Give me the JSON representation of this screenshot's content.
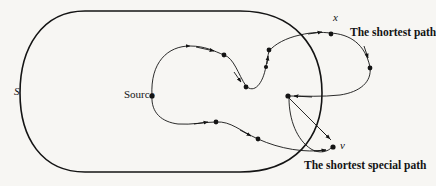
{
  "figure": {
    "type": "diagram",
    "width": 436,
    "height": 186,
    "background_color": "#f7f6f3",
    "stroke_color": "#141414",
    "node_color": "#141414"
  },
  "labels": {
    "region": "S",
    "source": "Source",
    "node_x": "x",
    "node_v": "v",
    "shortest_path": "The shortest path",
    "shortest_special_path": "The shortest special path"
  },
  "geometry": {
    "region_boundary": {
      "name": "set-S-boundary",
      "description": "large rounded stadium shape enclosing the left portion of the figure",
      "path": "M 85 11 L 240 11 C 295 11 322 48 322 93 C 322 138 295 172 240 172 L 85 172 C 42 172 20 138 20 93 C 20 48 42 11 85 11 Z"
    },
    "upper_path": {
      "name": "shortest-path-curve",
      "description": "wavy curve from Source rightward through interior nodes up to node x, then looping right and back to the junction node",
      "segments": [
        "M 152 96 C 152 60 168 46 190 46 C 208 46 215 52 224 55",
        "M 224 55 C 236 59 239 77 246 85 C 253 93 262 82 266 70 C 271 56 276 46 286 42 C 300 36 313 32 330 32",
        "M 330 32 C 352 32 368 44 370 58 C 372 73 363 86 350 92 C 335 99 310 97 290 96"
      ],
      "nodes": [
        {
          "name": "node-source",
          "x": 152,
          "y": 96
        },
        {
          "name": "node-u1",
          "x": 224,
          "y": 55
        },
        {
          "name": "node-u2",
          "x": 246,
          "y": 86
        },
        {
          "name": "node-u3",
          "x": 266,
          "y": 64
        },
        {
          "name": "node-u4",
          "x": 268,
          "y": 51
        },
        {
          "name": "node-x",
          "x": 330,
          "y": 33
        },
        {
          "name": "node-u5",
          "x": 370,
          "y": 67
        },
        {
          "name": "node-junction",
          "x": 288,
          "y": 96
        }
      ],
      "arrowheads": [
        {
          "name": "arrow-to-u1",
          "x": 214,
          "y": 51
        },
        {
          "name": "arrow-to-u2",
          "x": 241,
          "y": 82
        },
        {
          "name": "arrow-to-u4",
          "x": 268,
          "y": 57
        },
        {
          "name": "arrow-to-x",
          "x": 321,
          "y": 31
        },
        {
          "name": "arrow-to-u5",
          "x": 368,
          "y": 58
        },
        {
          "name": "arrow-to-junction",
          "x": 296,
          "y": 96
        }
      ]
    },
    "lower_path": {
      "name": "shortest-special-path-curve",
      "description": "curve from Source downward and rightward through interior nodes to node v",
      "segments": [
        "M 152 96 C 152 112 162 122 178 124 C 190 125 202 122 216 122",
        "M 216 122 C 232 122 240 132 258 139 C 276 146 300 148 315 148",
        "M 315 148 C 326 148 332 146 333 145"
      ],
      "nodes": [
        {
          "name": "node-l1",
          "x": 216,
          "y": 122
        },
        {
          "name": "node-l2",
          "x": 258,
          "y": 139
        },
        {
          "name": "node-v",
          "x": 333,
          "y": 146
        }
      ],
      "arrowheads": [
        {
          "name": "arrow-to-l1",
          "x": 207,
          "y": 121
        },
        {
          "name": "arrow-to-l2",
          "x": 250,
          "y": 135
        },
        {
          "name": "arrow-to-v-upper",
          "x": 330,
          "y": 138
        },
        {
          "name": "arrow-to-v-lower",
          "x": 325,
          "y": 150
        }
      ]
    },
    "crossing_edges": {
      "name": "junction-edges",
      "description": "two straight-ish edges descending from the junction node toward node v",
      "paths": [
        "M 288 97 L 330 140",
        "M 288 97 C 291 120 300 140 315 150 C 321 153 328 151 332 147"
      ]
    }
  }
}
